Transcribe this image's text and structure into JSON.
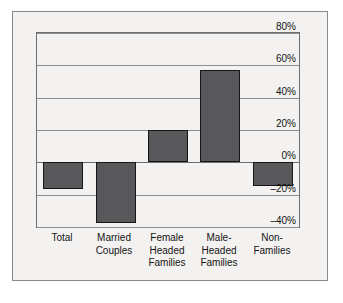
{
  "chart_data": {
    "type": "bar",
    "title": "",
    "xlabel": "",
    "ylabel": "",
    "categories": [
      "Total",
      "Married\nCouples",
      "Female\nHeaded\nFamilies",
      "Male-\nHeaded\nFamilies",
      "Non-\nFamilies"
    ],
    "values": [
      -17,
      -38,
      20,
      57,
      -15
    ],
    "ylim": [
      -40,
      80
    ],
    "ytick_values": [
      80,
      60,
      40,
      20,
      0,
      -20,
      -40
    ],
    "ytick_labels": [
      "80%",
      "60%",
      "40%",
      "20%",
      "0%",
      "–20%",
      "–40%"
    ],
    "grid": true,
    "legend": false,
    "bar_color": "#58585a",
    "bar_edge_color": "#16161a",
    "plot_background": "#f3f2f0",
    "gridline_color": "#8d8d8d"
  }
}
